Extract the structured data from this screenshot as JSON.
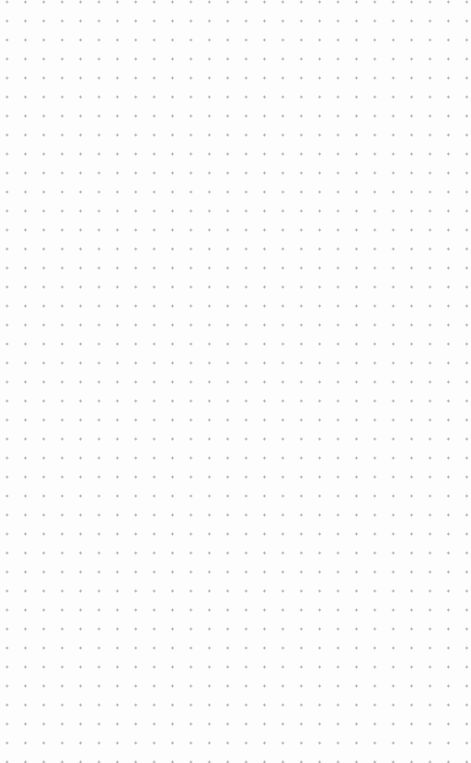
{
  "canvas": {
    "type": "dot-grid",
    "background_color": "#fdfdfd",
    "dot_color": "#a4a4a4",
    "spacing_x": 18.4,
    "spacing_y": 19,
    "origin_x": 7,
    "origin_y": 2
  }
}
